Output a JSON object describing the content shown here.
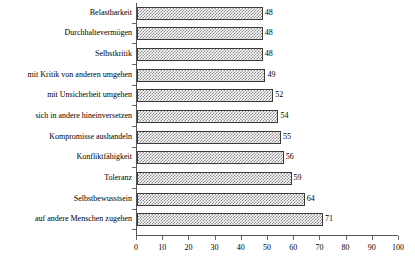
{
  "chart_data": {
    "type": "bar",
    "orientation": "horizontal",
    "title": "",
    "subtitle": "",
    "xlabel": "",
    "ylabel": "",
    "xlim": [
      0,
      100
    ],
    "xticks": [
      0,
      10,
      20,
      30,
      40,
      50,
      60,
      70,
      80,
      90,
      100
    ],
    "grid": false,
    "legend": null,
    "categories": [
      "Belastbarkeit",
      "Durchhaltevermögen",
      "Selbstkritik",
      "mit Kritik von anderen umgehen",
      "mit Unsicherheit umgehen",
      "sich in andere hineinversetzen",
      "Kompromisse aushandeln",
      "Konfliktfähigkeit",
      "Toleranz",
      "Selbstbewusstsein",
      "auf andere Menschen zugehen"
    ],
    "values": [
      48,
      48,
      48,
      49,
      52,
      54,
      55,
      56,
      59,
      64,
      71
    ],
    "value_labels": [
      "48",
      "48",
      "48",
      "49",
      "52",
      "54",
      "55",
      "56",
      "59",
      "64",
      "71"
    ],
    "colors": {
      "bar_fill": "#8a8a8a",
      "bar_background": "#ffffff",
      "bar_border": "#3a3a3a",
      "axis": "#555555",
      "text": "#000000",
      "plot_background": "#ffffff"
    },
    "bar_pattern": "checkerboard"
  }
}
